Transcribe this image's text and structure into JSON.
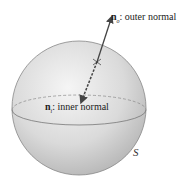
{
  "diagram": {
    "outer_normal": {
      "symbol": "n",
      "subscript": "o",
      "text": ": outer normal"
    },
    "inner_normal": {
      "symbol": "n",
      "subscript": "i",
      "text": ": inner normal"
    },
    "surface_label": "S",
    "colors": {
      "sphere_light": "#f4f4f4",
      "sphere_dark": "#b8b8b8",
      "outline": "#777777",
      "arrow": "#444444"
    }
  }
}
